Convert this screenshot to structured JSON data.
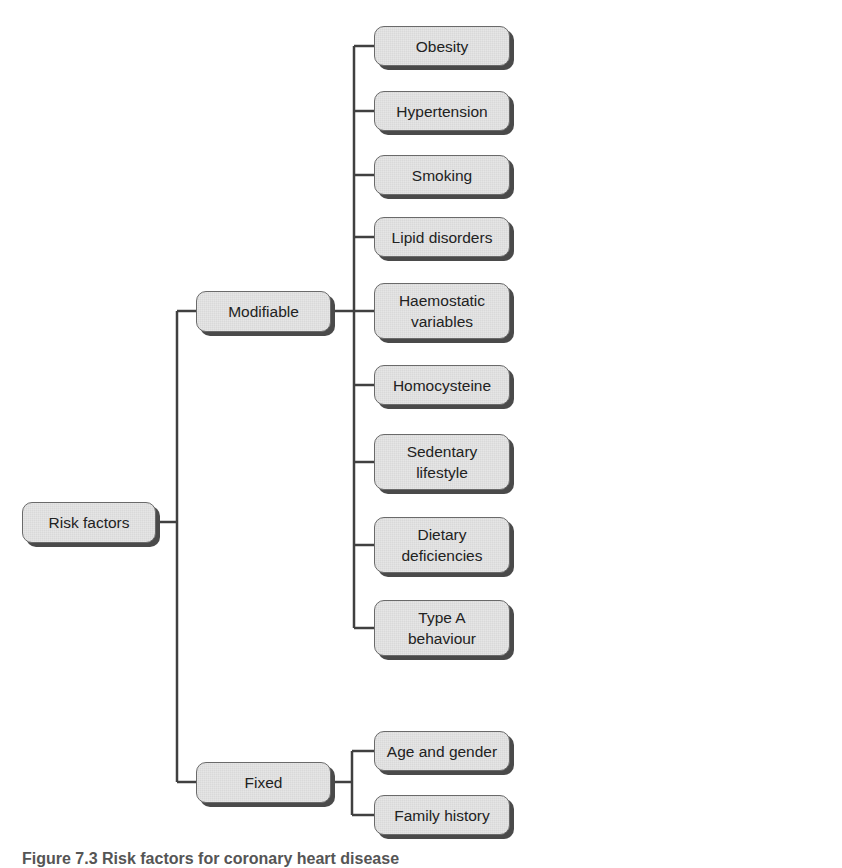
{
  "diagram": {
    "root": "Risk factors",
    "branches": [
      {
        "label": "Modifiable",
        "children": [
          "Obesity",
          "Hypertension",
          "Smoking",
          "Lipid disorders",
          "Haemostatic\nvariables",
          "Homocysteine",
          "Sedentary\nlifestyle",
          "Dietary\ndeficiencies",
          "Type A\nbehaviour"
        ]
      },
      {
        "label": "Fixed",
        "children": [
          "Age and gender",
          "Family history"
        ]
      }
    ]
  },
  "caption": "Figure 7.3 Risk factors for coronary heart disease",
  "colors": {
    "node_fill": "#d9d9d9",
    "node_border": "#6a6a6a",
    "shadow": "#4a4a4a",
    "connector": "#404040"
  }
}
